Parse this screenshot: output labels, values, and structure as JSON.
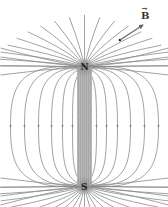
{
  "diagram": {
    "north_pole_label": "N",
    "south_pole_label": "S",
    "field_vector_label": "B",
    "field_vector_accent": "→",
    "colors": {
      "field_line": "#8a8a8a",
      "magnet_fill": "#b8b8b8",
      "magnet_stripe": "#9a9a9a",
      "text": "#222222",
      "background": "#ffffff"
    },
    "magnet": {
      "x_left": 77,
      "x_right": 92,
      "y_north": 67,
      "y_south": 186
    },
    "field_line_count_per_side": 8
  }
}
